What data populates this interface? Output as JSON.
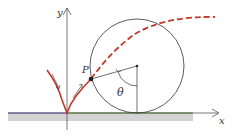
{
  "diagram": {
    "labels": {
      "y_axis": "y",
      "x_axis": "x",
      "point": "P",
      "angle": "θ"
    },
    "colors": {
      "curve": "#c0392b",
      "circle": "#333333",
      "ground_top": "#6b8f4e",
      "ground_fill": "#d0d0d0",
      "axes": "#555555"
    }
  }
}
